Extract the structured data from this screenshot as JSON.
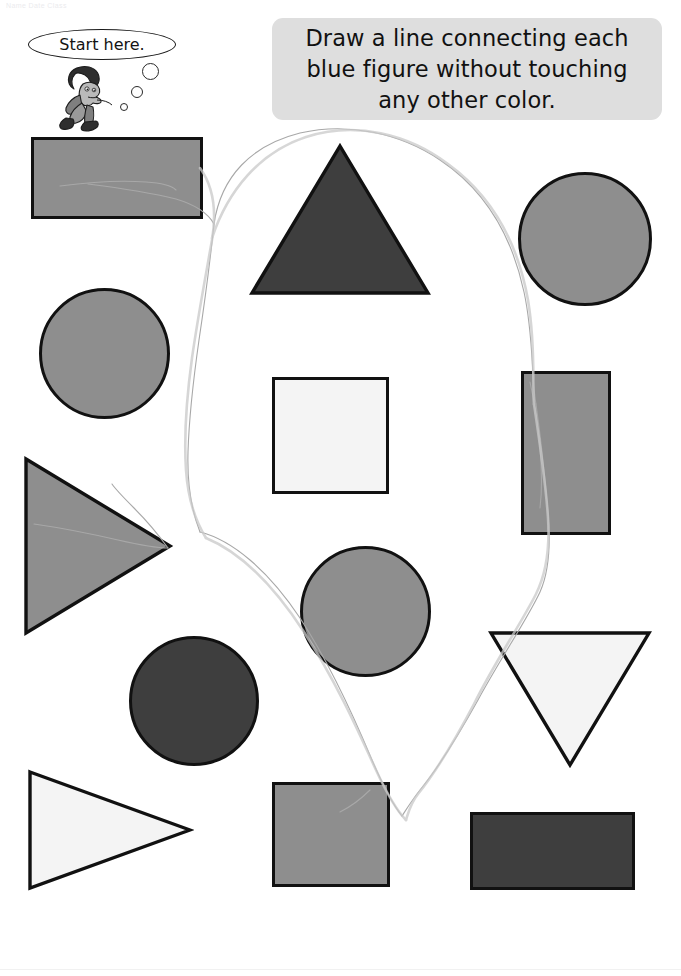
{
  "page": {
    "width": 681,
    "height": 976,
    "background": "#ffffff",
    "ghost_header": "Name                Date                Class"
  },
  "instruction": {
    "text": "Draw a line connecting each blue figure without touching any other color.",
    "box_color": "#dedede",
    "text_color": "#111111"
  },
  "start_marker": {
    "label": "Start here.",
    "bubble_count": 3,
    "character": "boy-crouching-icon"
  },
  "palette": {
    "outline": "#111111",
    "blue_fill": "#8e8e8e",
    "dark_fill": "#3e3e3e",
    "white_fill": "#f4f4f4",
    "pencil": "#9a9a9a"
  },
  "shapes": [
    {
      "id": "rect-top-left",
      "kind": "rectangle",
      "fill_name": "blue",
      "fill": "#8e8e8e",
      "x": 31,
      "y": 137,
      "w": 172,
      "h": 82,
      "target": true
    },
    {
      "id": "triangle-top-center",
      "kind": "triangle-up",
      "fill_name": "other",
      "fill": "#3e3e3e",
      "x": 248,
      "y": 142,
      "w": 184,
      "h": 155,
      "target": false
    },
    {
      "id": "circle-top-right",
      "kind": "circle",
      "fill_name": "blue",
      "fill": "#8e8e8e",
      "x": 518,
      "y": 172,
      "w": 134,
      "h": 134,
      "target": true
    },
    {
      "id": "circle-mid-left",
      "kind": "circle",
      "fill_name": "blue",
      "fill": "#8e8e8e",
      "x": 39,
      "y": 288,
      "w": 131,
      "h": 131,
      "target": true
    },
    {
      "id": "square-center",
      "kind": "square",
      "fill_name": "white",
      "fill": "#f4f4f4",
      "x": 272,
      "y": 377,
      "w": 117,
      "h": 117,
      "target": false
    },
    {
      "id": "rect-right-vertical",
      "kind": "rectangle",
      "fill_name": "blue",
      "fill": "#8e8e8e",
      "x": 521,
      "y": 371,
      "w": 90,
      "h": 164,
      "target": true
    },
    {
      "id": "triangle-left",
      "kind": "triangle-right",
      "fill_name": "blue",
      "fill": "#8e8e8e",
      "x": 22,
      "y": 455,
      "w": 152,
      "h": 182,
      "target": true
    },
    {
      "id": "circle-center",
      "kind": "circle",
      "fill_name": "blue",
      "fill": "#8e8e8e",
      "x": 300,
      "y": 546,
      "w": 131,
      "h": 131,
      "target": true
    },
    {
      "id": "circle-bottom-left",
      "kind": "circle",
      "fill_name": "other",
      "fill": "#3e3e3e",
      "x": 129,
      "y": 636,
      "w": 130,
      "h": 130,
      "target": false
    },
    {
      "id": "triangle-right-down",
      "kind": "triangle-down",
      "fill_name": "white",
      "fill": "#f4f4f4",
      "x": 487,
      "y": 629,
      "w": 166,
      "h": 140,
      "target": false
    },
    {
      "id": "triangle-bottom-left",
      "kind": "triangle-right",
      "fill_name": "white",
      "fill": "#f4f4f4",
      "x": 26,
      "y": 768,
      "w": 168,
      "h": 124,
      "target": false
    },
    {
      "id": "square-bottom-center",
      "kind": "square",
      "fill_name": "blue",
      "fill": "#8e8e8e",
      "x": 272,
      "y": 782,
      "w": 118,
      "h": 105,
      "target": true
    },
    {
      "id": "rect-bottom-right",
      "kind": "rectangle",
      "fill_name": "other",
      "fill": "#3e3e3e",
      "x": 470,
      "y": 812,
      "w": 165,
      "h": 78,
      "target": false
    }
  ]
}
